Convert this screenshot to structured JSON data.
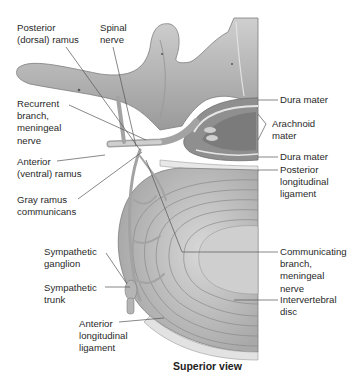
{
  "figure": {
    "caption": "Superior view",
    "colors": {
      "bone": "#b9b9b9",
      "bone_dark": "#8c8c8c",
      "nerve": "#a6a6a6",
      "disc_ring": "#c4c4c4",
      "nucleus": "#d6d6d6",
      "leader_line": "#555555",
      "text": "#2a2a2a"
    },
    "labels_left": [
      {
        "id": "posterior-ramus",
        "text": "Posterior\n(dorsal) ramus"
      },
      {
        "id": "spinal-nerve",
        "text": "Spinal\nnerve"
      },
      {
        "id": "recurrent-branch",
        "text": "Recurrent\nbranch,\nmeningeal\nnerve"
      },
      {
        "id": "anterior-ramus",
        "text": "Anterior\n(ventral) ramus"
      },
      {
        "id": "gray-ramus",
        "text": "Gray ramus\ncommunicans"
      },
      {
        "id": "sympathetic-ganglion",
        "text": "Sympathetic\nganglion"
      },
      {
        "id": "sympathetic-trunk",
        "text": "Sympathetic\ntrunk"
      },
      {
        "id": "anterior-longitudinal-ligament",
        "text": "Anterior\nlongitudinal\nligament"
      }
    ],
    "labels_right": [
      {
        "id": "dura-mater-1",
        "text": "Dura mater"
      },
      {
        "id": "arachnoid-mater",
        "text": "Arachnoid\nmater"
      },
      {
        "id": "dura-mater-2",
        "text": "Dura mater"
      },
      {
        "id": "posterior-longitudinal-ligament",
        "text": "Posterior\nlongitudinal\nligament"
      },
      {
        "id": "communicating-branch",
        "text": "Communicating\nbranch,\nmeningeal\nnerve"
      },
      {
        "id": "intervertebral-disc",
        "text": "Intervertebral\ndisc"
      }
    ]
  }
}
